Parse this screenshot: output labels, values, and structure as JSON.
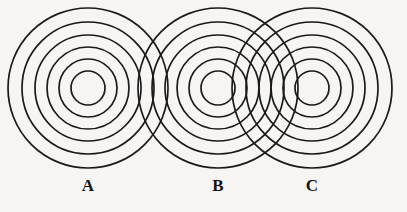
{
  "figure": {
    "background_color": "#f6f5f3",
    "stroke_color": "#1a1a1a",
    "width": 407,
    "height": 212
  },
  "chart_data": {
    "type": "diagram",
    "title": "",
    "subtitle": "",
    "xlabel": "",
    "ylabel": "",
    "grid": false,
    "legend": "none",
    "center_y": 88,
    "ring_count": 6,
    "ring_radii": [
      17,
      29,
      41,
      53,
      66,
      80
    ],
    "stroke_width": 1.7,
    "sources": [
      {
        "label": "A",
        "cx": 88,
        "cy": 88,
        "label_x": 88,
        "label_y": 177
      },
      {
        "label": "B",
        "cx": 218,
        "cy": 88,
        "label_x": 218,
        "label_y": 177
      },
      {
        "label": "C",
        "cx": 312,
        "cy": 88,
        "label_x": 312,
        "label_y": 177
      }
    ],
    "separations": {
      "A_to_B": 130,
      "B_to_C": 94,
      "A_to_C": 224
    }
  },
  "labels": {
    "a": "A",
    "b": "B",
    "c": "C"
  }
}
